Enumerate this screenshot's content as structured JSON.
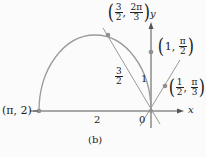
{
  "diagram": {
    "caption": "(b)",
    "axis_labels": {
      "x": "x",
      "y": "y",
      "origin": "0"
    },
    "points": [
      {
        "id": "pi-2",
        "label": "(π, 2)",
        "r": "2",
        "theta": "π"
      },
      {
        "id": "three-halves-2pi-3",
        "r_num": "3",
        "r_den": "2",
        "t_num": "2π",
        "t_den": "3"
      },
      {
        "id": "one-pi-2",
        "r": "1",
        "t_num": "π",
        "t_den": "2"
      },
      {
        "id": "half-pi-3",
        "r_num": "1",
        "r_den": "2",
        "t_num": "π",
        "t_den": "3"
      }
    ],
    "segment_labels": {
      "radius_2": "2",
      "radius_1": "1",
      "radius_3_2_num": "3",
      "radius_3_2_den": "2"
    },
    "colors": {
      "curve": "#9a9a9a",
      "axis": "#555555",
      "point": "#8f8f8f",
      "text": "#222222"
    }
  }
}
